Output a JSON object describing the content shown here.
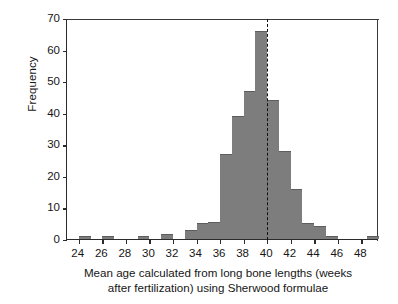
{
  "chart_data": {
    "type": "bar",
    "title": "",
    "subtitle": "",
    "xlabel_line1": "Mean age calculated from long bone lengths (weeks",
    "xlabel_line2": "after fertilization) using Sherwood formulae",
    "ylabel": "Frequency",
    "grid": false,
    "legend": null,
    "xlim": [
      23.0,
      49.5
    ],
    "ylim": [
      0,
      70
    ],
    "xticks": [
      24,
      26,
      28,
      30,
      32,
      34,
      36,
      38,
      40,
      42,
      44,
      46,
      48
    ],
    "yticks": [
      0,
      10,
      20,
      30,
      40,
      50,
      60,
      70
    ],
    "bin_width": 1,
    "bar_color": "#7d7d7d",
    "axis_color": "#2b2b2b",
    "annotations": [
      {
        "name": "reference-line",
        "type": "vertical-dashed-line",
        "x": 40,
        "color": "#111111"
      }
    ],
    "bins": [
      {
        "x0": 24.0,
        "x1": 25.0,
        "value": 1
      },
      {
        "x0": 26.0,
        "x1": 27.0,
        "value": 1
      },
      {
        "x0": 29.0,
        "x1": 30.0,
        "value": 1
      },
      {
        "x0": 31.0,
        "x1": 32.0,
        "value": 1.5
      },
      {
        "x0": 33.0,
        "x1": 34.0,
        "value": 3
      },
      {
        "x0": 34.0,
        "x1": 35.0,
        "value": 5
      },
      {
        "x0": 35.0,
        "x1": 36.0,
        "value": 5.5
      },
      {
        "x0": 36.0,
        "x1": 37.0,
        "value": 27
      },
      {
        "x0": 37.0,
        "x1": 38.0,
        "value": 39
      },
      {
        "x0": 38.0,
        "x1": 39.0,
        "value": 47
      },
      {
        "x0": 39.0,
        "x1": 40.0,
        "value": 66
      },
      {
        "x0": 40.0,
        "x1": 41.0,
        "value": 44
      },
      {
        "x0": 41.0,
        "x1": 42.0,
        "value": 28
      },
      {
        "x0": 42.0,
        "x1": 43.0,
        "value": 16
      },
      {
        "x0": 43.0,
        "x1": 44.0,
        "value": 5
      },
      {
        "x0": 44.0,
        "x1": 45.0,
        "value": 4
      },
      {
        "x0": 45.0,
        "x1": 46.0,
        "value": 1
      },
      {
        "x0": 48.5,
        "x1": 49.5,
        "value": 1
      }
    ],
    "categories": [
      "24-25",
      "26-27",
      "29-30",
      "31-32",
      "33-34",
      "34-35",
      "35-36",
      "36-37",
      "37-38",
      "38-39",
      "39-40",
      "40-41",
      "41-42",
      "42-43",
      "43-44",
      "44-45",
      "45-46",
      "48.5-49.5"
    ],
    "values": [
      1,
      1,
      1,
      1.5,
      3,
      5,
      5.5,
      27,
      39,
      47,
      66,
      44,
      28,
      16,
      5,
      4,
      1,
      1
    ]
  }
}
